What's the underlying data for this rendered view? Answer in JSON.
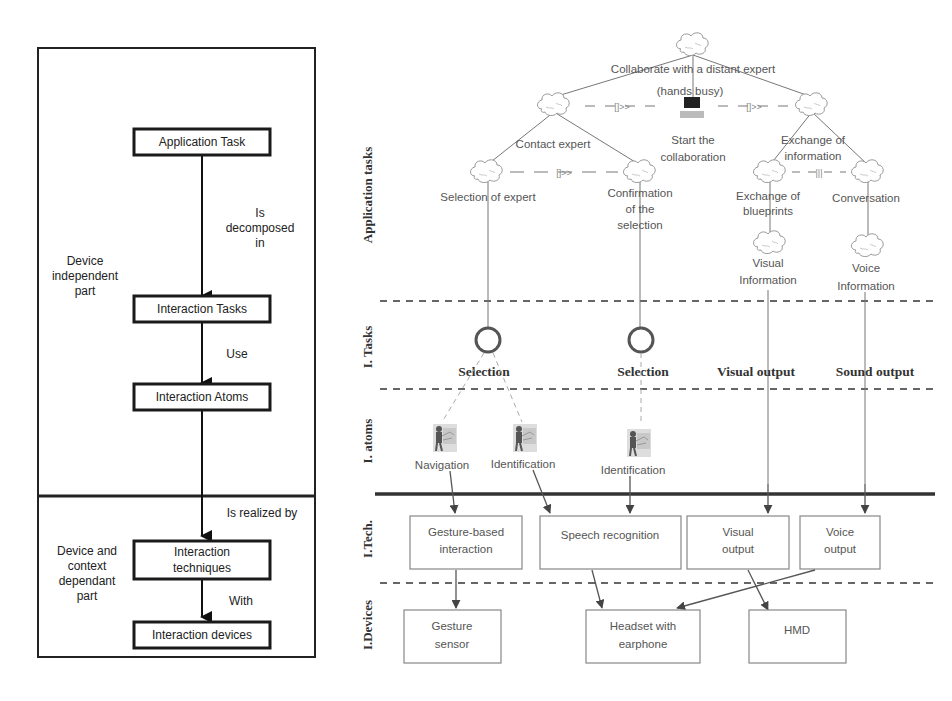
{
  "left_panel": {
    "boxes": [
      {
        "id": "application-task",
        "label": "Application Task"
      },
      {
        "id": "interaction-tasks",
        "label": "Interaction Tasks"
      },
      {
        "id": "interaction-atoms",
        "label": "Interaction Atoms"
      },
      {
        "id": "interaction-techniques",
        "label_lines": [
          "Interaction",
          "techniques"
        ]
      },
      {
        "id": "interaction-devices",
        "label": "Interaction devices"
      }
    ],
    "edge_labels": {
      "decomposed": [
        "Is",
        "decomposed",
        "in"
      ],
      "use": "Use",
      "realized": "Is realized by",
      "with": "With"
    },
    "regions": {
      "independent": [
        "Device",
        "independent",
        "part"
      ],
      "dependent": [
        "Device and",
        "context",
        "dependant",
        "part"
      ]
    }
  },
  "right_panel": {
    "layers": {
      "application_tasks": "Application tasks",
      "interaction_tasks": "I. Tasks",
      "interaction_atoms": "I. atoms",
      "interaction_techniques": "I.Tech.",
      "interaction_devices": "I.Devices"
    },
    "task_tree": {
      "root": [
        "Collaborate with a distant expert",
        "(hands busy)"
      ],
      "contact_expert": "Contact expert",
      "start_collab": [
        "Start the",
        "collaboration"
      ],
      "exchange_info": [
        "Exchange of",
        "information"
      ],
      "selection_expert": "Selection of expert",
      "confirmation": [
        "Confirmation",
        "of the",
        "selection"
      ],
      "exchange_blueprints": [
        "Exchange of",
        "blueprints"
      ],
      "conversation": "Conversation",
      "visual_info": [
        "Visual",
        "Information"
      ],
      "voice_info": [
        "Voice",
        "Information"
      ],
      "operators": {
        "enabling": "[]>>",
        "interleaving": "|||"
      }
    },
    "interaction_tasks": [
      "Selection",
      "Selection",
      "Visual output",
      "Sound output"
    ],
    "interaction_atoms": [
      "Navigation",
      "Identification",
      "Identification"
    ],
    "techniques": {
      "gesture": [
        "Gesture-based",
        "interaction"
      ],
      "speech": "Speech recognition",
      "visual": [
        "Visual",
        "output"
      ],
      "voice": [
        "Voice",
        "output"
      ]
    },
    "devices": {
      "gesture_sensor": [
        "Gesture",
        "sensor"
      ],
      "headset": [
        "Headset with",
        "earphone"
      ],
      "hmd": "HMD"
    }
  }
}
